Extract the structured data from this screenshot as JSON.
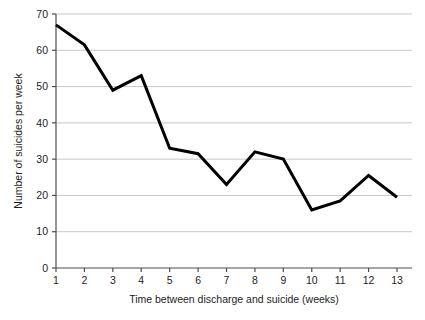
{
  "chart_data": {
    "type": "line",
    "title": "",
    "subtitle": "",
    "xlabel": "Time between discharge and suicide (weeks)",
    "ylabel": "Number of suicides per week",
    "x": [
      1,
      2,
      3,
      4,
      5,
      6,
      7,
      8,
      9,
      10,
      11,
      12,
      13
    ],
    "categories": [
      "1",
      "2",
      "3",
      "4",
      "5",
      "6",
      "7",
      "8",
      "9",
      "10",
      "11",
      "12",
      "13"
    ],
    "values": [
      67,
      61.5,
      49,
      53,
      33,
      31.5,
      23,
      32,
      30,
      16,
      18.5,
      25.5,
      19.5
    ],
    "series": [
      {
        "name": "Suicides per week",
        "values": [
          67,
          61.5,
          49,
          53,
          33,
          31.5,
          23,
          32,
          30,
          16,
          18.5,
          25.5,
          19.5
        ],
        "color": "#000000"
      }
    ],
    "xlim": [
      1,
      13
    ],
    "ylim": [
      0,
      70
    ],
    "xticks": [
      1,
      2,
      3,
      4,
      5,
      6,
      7,
      8,
      9,
      10,
      11,
      12,
      13
    ],
    "yticks": [
      0,
      10,
      20,
      30,
      40,
      50,
      60,
      70
    ],
    "xticklabels": [
      "1",
      "2",
      "3",
      "4",
      "5",
      "6",
      "7",
      "8",
      "9",
      "10",
      "11",
      "12",
      "13"
    ],
    "yticklabels": [
      "0",
      "10",
      "20",
      "30",
      "40",
      "50",
      "60",
      "70"
    ],
    "grid": {
      "horizontal": true,
      "vertical": false,
      "color": "#c8c8c8"
    },
    "legend": {
      "visible": false,
      "position": "none"
    },
    "markers": false,
    "line_width": 3,
    "background_color": "#ffffff",
    "axis_color": "#4d4d4d"
  }
}
